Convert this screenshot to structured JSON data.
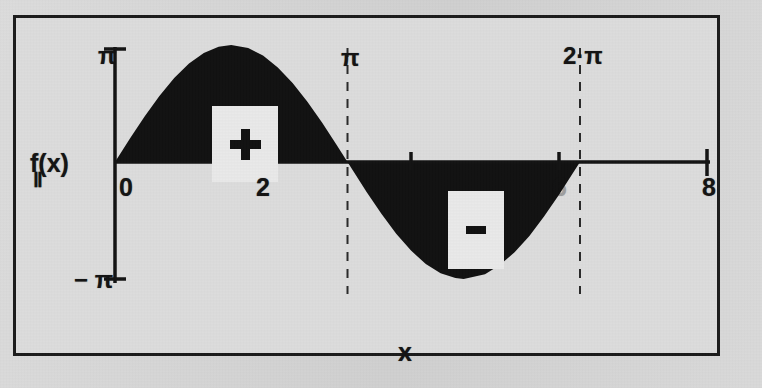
{
  "figure": {
    "background_color": "#dcdcdc",
    "border_color": "#1c1c1c",
    "ink_color": "#121212"
  },
  "labels": {
    "y_axis_name": "f(x)",
    "y_axis_name_sub": "Ⅱ",
    "x_axis_name": "x",
    "y_top": "π",
    "y_bottom": "− π",
    "pi_line": "π",
    "two_pi_line": "2·π",
    "positive_region": "+",
    "negative_region": "-"
  },
  "chart_data": {
    "type": "line",
    "title": "",
    "subtitle": "",
    "xlabel": "x",
    "ylabel": "f(x)",
    "xlim": [
      0,
      8
    ],
    "ylim": [
      -3.14159,
      3.14159
    ],
    "grid": false,
    "legend": null,
    "x_ticks": [
      0,
      2,
      4,
      6,
      8
    ],
    "x_tick_labels": [
      "0",
      "2",
      "4",
      "6",
      "8"
    ],
    "y_ticks": [
      -3.14159,
      0,
      3.14159
    ],
    "y_tick_labels": [
      "− π",
      "",
      "π"
    ],
    "annotations": [
      {
        "type": "vline",
        "x": 3.14159,
        "label": "π",
        "style": "dashed"
      },
      {
        "type": "vline",
        "x": 6.28319,
        "label": "2·π",
        "style": "dashed"
      },
      {
        "type": "region",
        "label": "+",
        "x_range": [
          0,
          3.14159
        ],
        "sign": "positive"
      },
      {
        "type": "region",
        "label": "-",
        "x_range": [
          3.14159,
          6.28319
        ],
        "sign": "negative"
      }
    ],
    "series": [
      {
        "name": "f(x) = π·sin(x)",
        "fill": "area-to-zero",
        "fill_color": "#121212",
        "x": [
          0,
          0.2,
          0.4,
          0.6,
          0.8,
          1.0,
          1.2,
          1.4,
          1.5708,
          1.8,
          2.0,
          2.2,
          2.4,
          2.6,
          2.8,
          3.0,
          3.14159,
          3.4,
          3.6,
          3.8,
          4.0,
          4.2,
          4.4,
          4.6,
          4.7124,
          5.0,
          5.2,
          5.4,
          5.6,
          5.8,
          6.0,
          6.28319
        ],
        "values": [
          0,
          0.624,
          1.224,
          1.774,
          2.254,
          2.644,
          2.928,
          3.096,
          3.14159,
          3.059,
          2.857,
          2.539,
          2.121,
          1.617,
          1.053,
          0.443,
          0,
          -0.808,
          -1.389,
          -1.924,
          -2.378,
          -2.739,
          -2.988,
          -3.115,
          -3.14159,
          -3.013,
          -2.765,
          -2.425,
          -1.983,
          -1.459,
          -0.878,
          0
        ]
      }
    ]
  }
}
